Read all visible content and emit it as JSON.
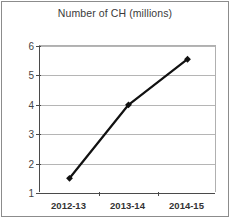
{
  "chart_data": {
    "type": "line",
    "title": "Number of CH (millions)",
    "xlabel": "",
    "ylabel": "",
    "categories": [
      "2012-13",
      "2013-14",
      "2014-15"
    ],
    "series": [
      {
        "name": "Number of CH (millions)",
        "values": [
          1.5,
          4.0,
          5.55
        ]
      }
    ],
    "ylim": [
      1,
      6
    ],
    "yticks": [
      1,
      2,
      3,
      4,
      5,
      6
    ],
    "ytick_labels": [
      "1",
      "2",
      "3",
      "4",
      "5",
      "6"
    ],
    "grid": true,
    "legend": false,
    "colors": {
      "line": "#111111",
      "marker": "#111111",
      "gridline": "#b5b5b5",
      "axis": "#4a4a4a",
      "frame": "#8c8c8c",
      "title_text": "#3a3a3a",
      "tick_text": "#444444",
      "background": "#ffffff"
    }
  }
}
